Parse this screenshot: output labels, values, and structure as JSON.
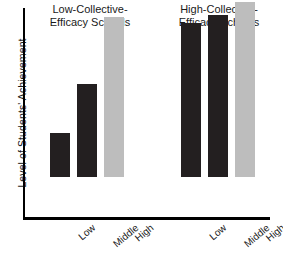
{
  "chart_data": {
    "type": "bar",
    "title": "",
    "xlabel": "",
    "ylabel": "Level of Students' Achievement",
    "grid": false,
    "legend": "none",
    "ylim": [
      0,
      100
    ],
    "axis_tick_labels": [],
    "groups": [
      {
        "name": "Low-Collective-Efficacy Schools",
        "title_lines": [
          "Low-Collective-",
          "Efficacy Schools"
        ],
        "categories": [
          "Low",
          "Middle",
          "High"
        ],
        "values": [
          21,
          44,
          76
        ],
        "colors": [
          "#231f20",
          "#231f20",
          "#bdbdbd"
        ]
      },
      {
        "name": "High-Collective-Efficacy Schools",
        "title_lines": [
          "High-Collective-",
          "Efficacy Schools"
        ],
        "categories": [
          "Low",
          "Middle",
          "High"
        ],
        "values": [
          73,
          77,
          83
        ],
        "colors": [
          "#231f20",
          "#231f20",
          "#bdbdbd"
        ]
      }
    ],
    "categories": [
      "Low",
      "Middle",
      "High"
    ],
    "series": [
      {
        "name": "Low-Collective-Efficacy Schools",
        "values": [
          21,
          44,
          76
        ]
      },
      {
        "name": "High-Collective-Efficacy Schools",
        "values": [
          73,
          77,
          83
        ]
      }
    ],
    "colors": {
      "dark_bar": "#231f20",
      "light_bar": "#bdbdbd",
      "axis": "#000000",
      "text": "#1a1a1a",
      "background": "#ffffff"
    }
  },
  "axis": {
    "y_title": "Level of Students' Achievement"
  },
  "groups": {
    "left": {
      "title_line1": "Low-Collective-",
      "title_line2": "Efficacy Schools",
      "ticks": [
        "Low",
        "Middle",
        "High"
      ]
    },
    "right": {
      "title_line1": "High-Collective-",
      "title_line2": "Efficacy Schools",
      "ticks": [
        "Low",
        "Middle",
        "High"
      ]
    }
  }
}
